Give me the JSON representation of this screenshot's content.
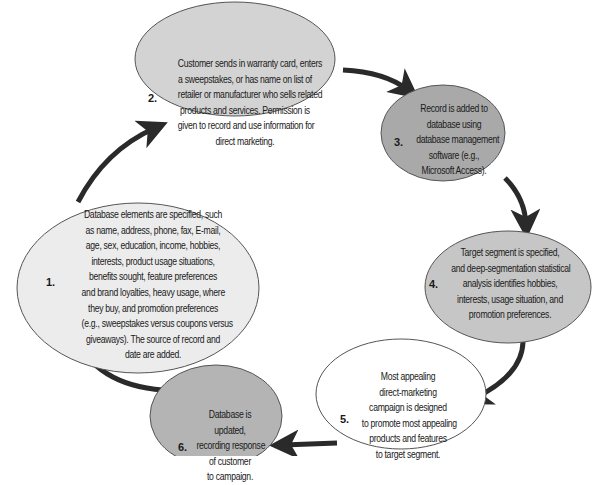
{
  "diagram": {
    "type": "cycle",
    "colors": {
      "arrow": "#2a2a2a",
      "outline": "#555555",
      "step1_fill": "#ececec",
      "step2_fill": "#d3d3d3",
      "step3_fill": "#a9a9a9",
      "step4_fill": "#c6c6c6",
      "step5_fill": "#ffffff",
      "step6_fill": "#b4b4b4"
    },
    "steps": [
      {
        "number": "1.",
        "lines": [
          "Database elements are specified, such",
          "as name, address, phone, fax, E-mail,",
          "age, sex, education, income, hobbies,",
          "interests, product usage situations,",
          "benefits sought, feature preferences",
          "and brand loyalties, heavy usage, where",
          "they buy, and promotion preferences",
          "(e.g., sweepstakes versus coupons versus",
          "giveaways). The source of record and",
          "date are added."
        ]
      },
      {
        "number": "2.",
        "lines": [
          "Customer sends in warranty card, enters",
          "a sweepstakes, or has name on list of",
          "retailer or manufacturer who sells related",
          "products and services. Permission is",
          "given to record and use information for",
          "direct marketing."
        ]
      },
      {
        "number": "3.",
        "lines": [
          "Record is added to",
          "database using",
          "database management",
          "software (e.g.,",
          "Microsoft Access)."
        ]
      },
      {
        "number": "4.",
        "lines": [
          "Target segment is specified,",
          "and deep-segmentation statistical",
          "analysis identifies hobbies,",
          "interests, usage situation, and",
          "promotion preferences."
        ]
      },
      {
        "number": "5.",
        "lines": [
          "Most appealing",
          "direct-marketing",
          "campaign is designed",
          "to promote most appealing",
          "products and features",
          "to target segment."
        ]
      },
      {
        "number": "6.",
        "lines": [
          "Database is",
          "updated,",
          "recording response",
          "of customer",
          "to campaign."
        ]
      }
    ],
    "flow": [
      "1 -> 2",
      "2 -> 3",
      "3 -> 4",
      "4 -> 5",
      "5 -> 6",
      "6 -> 1"
    ]
  }
}
